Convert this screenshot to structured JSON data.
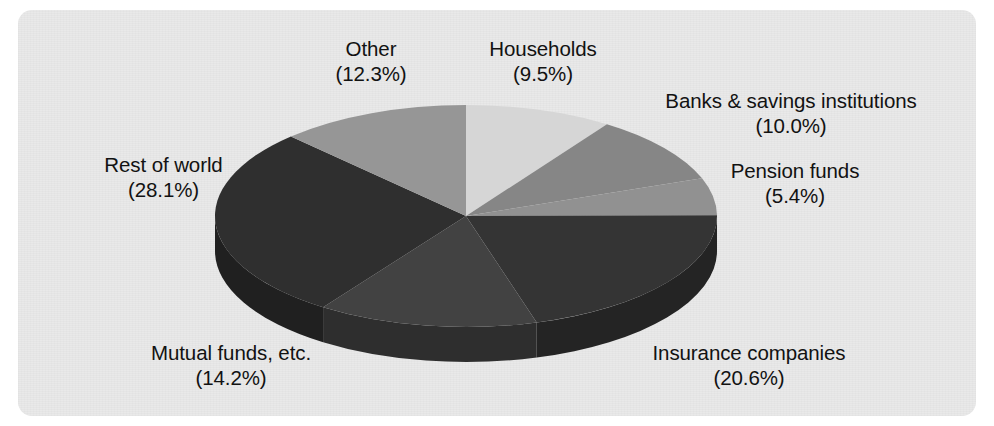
{
  "figure": {
    "panel_color": "#e9e9e9",
    "page_background": "#ffffff",
    "text_color": "#121212"
  },
  "chart_data": {
    "type": "pie",
    "title": "",
    "subtitle": "",
    "xlabel": "",
    "ylabel": "",
    "three_d": true,
    "legend_position": "none",
    "labels_position": "outside",
    "label_format": "name + (percent%)",
    "start_angle_deg": 0,
    "direction": "clockwise",
    "categories": [
      "Households",
      "Banks & savings institutions",
      "Pension funds",
      "Insurance companies",
      "Mutual funds, etc.",
      "Rest of world",
      "Other"
    ],
    "values": [
      9.5,
      10.0,
      5.4,
      20.6,
      14.2,
      28.1,
      12.3
    ],
    "units": "percent",
    "total": 100.1,
    "slices": [
      {
        "name": "Households",
        "value": 9.5,
        "label": "Households",
        "percent_label": "(9.5%)",
        "color": "#d6d6d6",
        "side_color": "#b4b4b4"
      },
      {
        "name": "Banks & savings institutions",
        "value": 10.0,
        "label": "Banks & savings institutions",
        "percent_label": "(10.0%)",
        "color": "#868686",
        "side_color": "#6b6b6b"
      },
      {
        "name": "Pension funds",
        "value": 5.4,
        "label": "Pension funds",
        "percent_label": "(5.4%)",
        "color": "#919191",
        "side_color": "#757575"
      },
      {
        "name": "Insurance companies",
        "value": 20.6,
        "label": "Insurance companies",
        "percent_label": "(20.6%)",
        "color": "#343434",
        "side_color": "#242424"
      },
      {
        "name": "Mutual funds, etc.",
        "value": 14.2,
        "label": "Mutual funds, etc.",
        "percent_label": "(14.2%)",
        "color": "#424242",
        "side_color": "#2e2e2e"
      },
      {
        "name": "Rest of world",
        "value": 28.1,
        "label": "Rest of world",
        "percent_label": "(28.1%)",
        "color": "#2f2f2f",
        "side_color": "#202020"
      },
      {
        "name": "Other",
        "value": 12.3,
        "label": "Other",
        "percent_label": "(12.3%)",
        "color": "#969696",
        "side_color": "#797979"
      }
    ]
  }
}
